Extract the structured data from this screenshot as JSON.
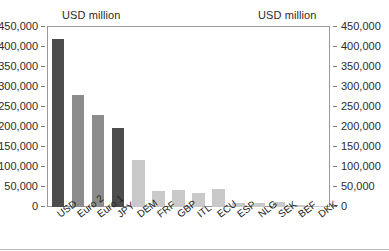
{
  "chart_data": {
    "type": "bar",
    "title": "",
    "xlabel": "",
    "ylabel": "USD million",
    "unit_caption_left": "USD million",
    "unit_caption_right": "USD million",
    "categories": [
      "USD",
      "Euro 2",
      "Euro 1",
      "JPY",
      "DEM",
      "FRF",
      "GBP",
      "ITL",
      "ECU",
      "ESP",
      "NLG",
      "SEK",
      "BEF",
      "DKK"
    ],
    "values": [
      420000,
      281000,
      231000,
      198000,
      117000,
      39000,
      43000,
      34000,
      46000,
      10000,
      10000,
      12000,
      6000,
      1500
    ],
    "bar_colors": [
      "#4d4d4d",
      "#8c8c8c",
      "#8c8c8c",
      "#4d4d4d",
      "#c9c9c9",
      "#c9c9c9",
      "#c9c9c9",
      "#c9c9c9",
      "#c9c9c9",
      "#c9c9c9",
      "#c9c9c9",
      "#c9c9c9",
      "#c9c9c9",
      "#c9c9c9"
    ],
    "ylim": [
      0,
      450000
    ],
    "ytick_step": 50000,
    "yticks": [
      450000,
      400000,
      350000,
      300000,
      250000,
      200000,
      150000,
      100000,
      50000,
      0
    ],
    "ytick_labels": [
      "450,000",
      "400,000",
      "350,000",
      "300,000",
      "250,000",
      "200,000",
      "150,000",
      "100,000",
      "50,000",
      "0"
    ],
    "right_axis_labels": [
      "450,000",
      "400,000",
      "350,000",
      "300,000",
      "250,000",
      "200,000",
      "150,000",
      "100,000",
      "50,000",
      "0"
    ],
    "grid": false,
    "legend": null,
    "legend_position": "none",
    "axis_line_color": "#9a9a9a",
    "text_color": "#2b2b2b",
    "background": "#ffffff"
  }
}
